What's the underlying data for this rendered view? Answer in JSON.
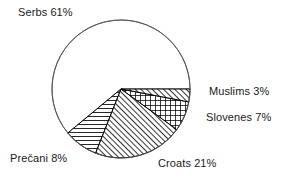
{
  "chart_data": {
    "type": "pie",
    "title": "",
    "subtitle": "",
    "xlabel": "",
    "ylabel": "",
    "grid": false,
    "legend_position": "none",
    "units": "percent",
    "total": 100,
    "start_angle_deg": 0,
    "direction": "clockwise",
    "geometry": {
      "center_x": 121,
      "center_y": 89,
      "radius": 69
    },
    "categories": [
      "Muslims",
      "Slovenes",
      "Croats",
      "Prečani",
      "Serbs"
    ],
    "values": [
      3,
      7,
      21,
      8,
      61
    ],
    "slices": [
      {
        "name": "Muslims",
        "value": 3,
        "label": "Muslims 3%",
        "pattern": "diagonal-hatch-up",
        "fill": "#ffffff",
        "stroke": "#000000",
        "start_deg": 0,
        "end_deg": 10.8,
        "label_side": "right"
      },
      {
        "name": "Slovenes",
        "value": 7,
        "label": "Slovenes 7%",
        "pattern": "crosshatch-grid",
        "fill": "#ffffff",
        "stroke": "#000000",
        "start_deg": 10.8,
        "end_deg": 36.0,
        "label_side": "right"
      },
      {
        "name": "Croats",
        "value": 21,
        "label": "Croats 21%",
        "pattern": "diagonal-hatch-up",
        "fill": "#ffffff",
        "stroke": "#000000",
        "start_deg": 36.0,
        "end_deg": 111.6,
        "label_side": "bottom"
      },
      {
        "name": "Prečani",
        "value": 8,
        "label": "Prečani 8%",
        "pattern": "horizontal-lines",
        "fill": "#ffffff",
        "stroke": "#000000",
        "start_deg": 111.6,
        "end_deg": 140.4,
        "label_side": "bottom-left"
      },
      {
        "name": "Serbs",
        "value": 61,
        "label": "Serbs 61%",
        "pattern": "none",
        "fill": "#ffffff",
        "stroke": "#000000",
        "start_deg": 140.4,
        "end_deg": 360.0,
        "label_side": "top-left"
      }
    ]
  },
  "labels": {
    "serbs": "Serbs 61%",
    "muslims": "Muslims 3%",
    "slovenes": "Slovenes 7%",
    "precani": "Prečani 8%",
    "croats": "Croats 21%"
  },
  "colors": {
    "background": "#ffffff",
    "outline": "#000000",
    "text": "#1a1a1a"
  }
}
